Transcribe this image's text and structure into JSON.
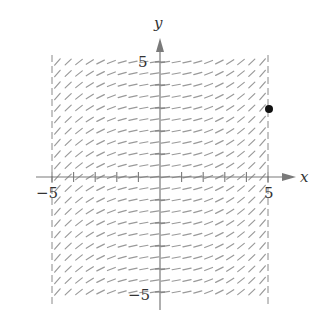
{
  "figure": {
    "type": "slope_field",
    "x_axis_label": "x",
    "y_axis_label": "y",
    "tick_labels": {
      "x_min": "−5",
      "x_max": "5",
      "y_max": "5",
      "y_min": "−5"
    },
    "colors": {
      "axis": "#7a7a7a",
      "segment": "#9a9a9a",
      "dashed_boundary": "#8a8a8a",
      "point": "#111111",
      "text": "#333333"
    }
  },
  "chart_data": {
    "type": "slope_field",
    "title": "",
    "xlabel": "x",
    "ylabel": "y",
    "xlim": [
      -5,
      5
    ],
    "ylim": [
      -5,
      5
    ],
    "x_ticks": [
      -5,
      -4,
      -3,
      -2,
      -1,
      0,
      1,
      2,
      3,
      4,
      5
    ],
    "y_ticks": [
      -5,
      -4,
      -3,
      -2,
      -1,
      0,
      1,
      2,
      3,
      4,
      5
    ],
    "tick_labels_shown": {
      "x": [
        -5,
        5
      ],
      "y": [
        -5,
        5
      ]
    },
    "grid_step": 0.5,
    "slope_model": "slope depends on x only; near 0 at x=0 (slightly positive), increasing toward |x|=5 on both sides (approx 0.15 + 0.042*x^2)",
    "boundary_lines": [
      {
        "x": -5,
        "style": "dashed"
      },
      {
        "x": 5,
        "style": "dashed"
      }
    ],
    "points": [
      {
        "x": 5,
        "y": 3,
        "label": ""
      }
    ]
  }
}
